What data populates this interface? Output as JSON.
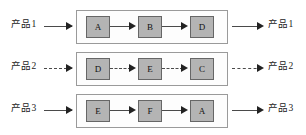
{
  "diagram": {
    "colors": {
      "process_box_fill": "#b4b4b4",
      "process_box_border": "#666666",
      "container_border": "#9a9a9a",
      "line": "#4a4a4a",
      "arrowhead": "#222222",
      "background": "#ffffff"
    },
    "rows": [
      {
        "input_label": "产品1",
        "output_label": "产品1",
        "line_style": "solid",
        "steps": [
          {
            "label": "A"
          },
          {
            "label": "B"
          },
          {
            "label": "D"
          }
        ]
      },
      {
        "input_label": "产品2",
        "output_label": "产品2",
        "line_style": "dashed",
        "steps": [
          {
            "label": "D"
          },
          {
            "label": "E"
          },
          {
            "label": "C"
          }
        ]
      },
      {
        "input_label": "产品3",
        "output_label": "产品3",
        "line_style": "solid",
        "steps": [
          {
            "label": "E"
          },
          {
            "label": "F"
          },
          {
            "label": "A"
          }
        ]
      }
    ]
  }
}
